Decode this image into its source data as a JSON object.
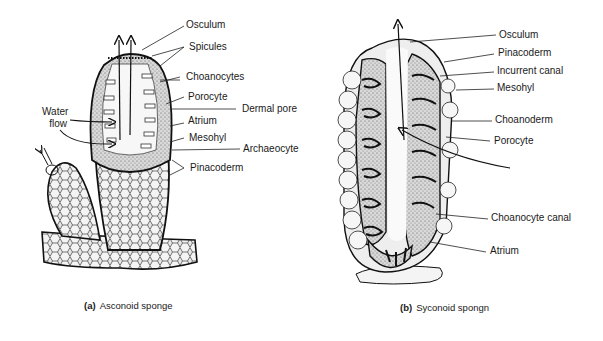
{
  "figure_a": {
    "caption_letter": "(a)",
    "caption_text": "Asconoid sponge",
    "labels": {
      "osculum": "Osculum",
      "spicules": "Spicules",
      "choanocytes": "Choanocytes",
      "porocyte": "Porocyte",
      "dermal_pore": "Dermal pore",
      "atrium": "Atrium",
      "mesohyl": "Mesohyl",
      "archaeocyte": "Archaeocyte",
      "pinacoderm": "Pinacoderm",
      "water_flow_1": "Water",
      "water_flow_2": "flow"
    }
  },
  "figure_b": {
    "caption_letter": "(b)",
    "caption_text": "Syconoid spongn",
    "labels": {
      "osculum": "Osculum",
      "pinacoderm": "Pinacoderm",
      "incurrent_canal": "Incurrent canal",
      "mesohyl": "Mesohyl",
      "choanoderm": "Choanoderm",
      "porocyte": "Porocyte",
      "choanocyte_canal": "Choanocyte canal",
      "atrium": "Atrium"
    }
  }
}
